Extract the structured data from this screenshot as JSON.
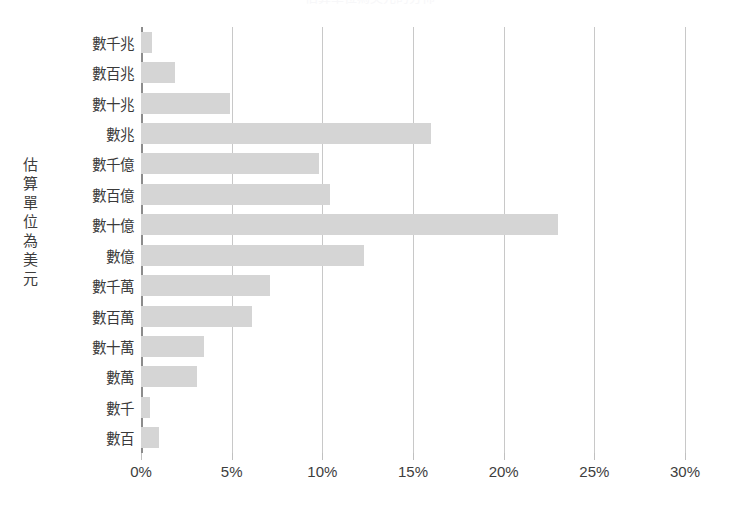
{
  "chart_data": {
    "type": "bar",
    "orientation": "horizontal",
    "title": "估算單位為美元的分佈",
    "xlabel": "",
    "ylabel": "估算單位為美元",
    "categories": [
      "數千兆",
      "數百兆",
      "數十兆",
      "數兆",
      "數千億",
      "數百億",
      "數十億",
      "數億",
      "數千萬",
      "數百萬",
      "數十萬",
      "數萬",
      "數千",
      "數百"
    ],
    "values": [
      0.6,
      1.9,
      4.9,
      16.0,
      9.8,
      10.4,
      23.0,
      12.3,
      7.1,
      6.1,
      3.5,
      3.1,
      0.5,
      1.0
    ],
    "value_unit": "%",
    "xlim": [
      0,
      30
    ],
    "xticks": [
      0,
      5,
      10,
      15,
      20,
      25,
      30
    ],
    "xtick_labels": [
      "0%",
      "5%",
      "10%",
      "15%",
      "20%",
      "25%",
      "30%"
    ],
    "grid": true,
    "grid_axis": "x",
    "legend": false,
    "bar_color": "#d5d5d5",
    "gridline_color": "#c8c8c8",
    "axis_color": "#8c8c8c",
    "text_color": "#3d3d3d",
    "background": "#ffffff"
  },
  "axis_title": {
    "y": "估算單位為美元"
  }
}
